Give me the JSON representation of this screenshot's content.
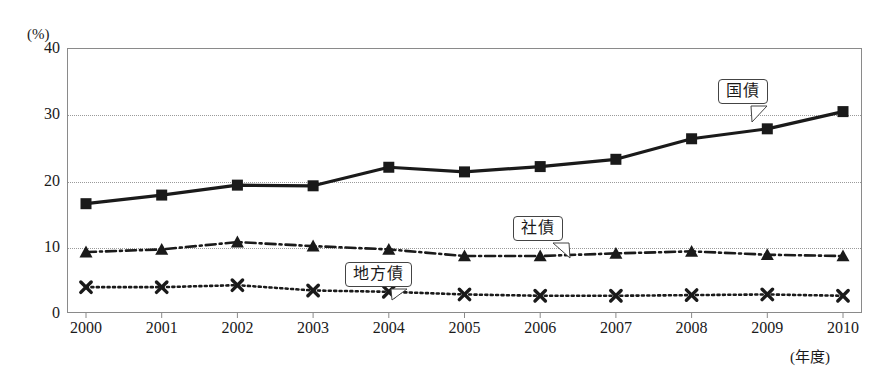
{
  "title": "",
  "axes": {
    "y_unit": "(%)",
    "y_ticks": [
      "0",
      "10",
      "20",
      "30",
      "40"
    ],
    "x_unit": "(年度)",
    "x_ticks": [
      "2000",
      "2001",
      "2002",
      "2003",
      "2004",
      "2005",
      "2006",
      "2007",
      "2008",
      "2009",
      "2010"
    ]
  },
  "callouts": {
    "kokusai": "国債",
    "shasai": "社債",
    "chihou": "地方債"
  },
  "chart_data": {
    "type": "line",
    "title": "",
    "xlabel": "(年度)",
    "ylabel": "(%)",
    "ylim": [
      0,
      40
    ],
    "yticks": [
      0,
      10,
      20,
      30,
      40
    ],
    "grid": "horizontal-dotted",
    "legend": "inline-callouts",
    "x": [
      2000,
      2001,
      2002,
      2003,
      2004,
      2005,
      2006,
      2007,
      2008,
      2009,
      2010
    ],
    "categories": [
      "2000",
      "2001",
      "2002",
      "2003",
      "2004",
      "2005",
      "2006",
      "2007",
      "2008",
      "2009",
      "2010"
    ],
    "series": [
      {
        "name": "国債",
        "marker": "square",
        "linestyle": "solid",
        "color": "#1a1a1a",
        "values": [
          16.5,
          17.8,
          19.3,
          19.2,
          22.0,
          21.3,
          22.1,
          23.2,
          26.3,
          27.8,
          30.4
        ]
      },
      {
        "name": "社債",
        "marker": "triangle",
        "linestyle": "dash-dot",
        "color": "#1a1a1a",
        "values": [
          9.2,
          9.6,
          10.7,
          10.1,
          9.6,
          8.6,
          8.6,
          9.0,
          9.3,
          8.8,
          8.6
        ]
      },
      {
        "name": "地方債",
        "marker": "cross",
        "linestyle": "dotted",
        "color": "#1a1a1a",
        "values": [
          3.9,
          3.9,
          4.2,
          3.4,
          3.2,
          2.8,
          2.6,
          2.6,
          2.7,
          2.8,
          2.6
        ]
      }
    ]
  }
}
